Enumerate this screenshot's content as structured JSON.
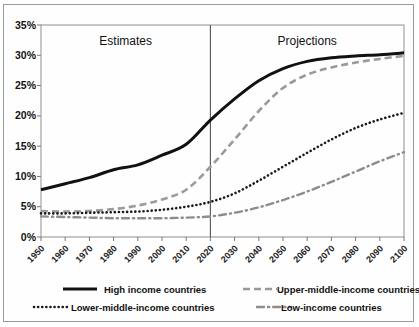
{
  "chart_data": {
    "type": "line",
    "title": "",
    "xlabel": "",
    "ylabel": "",
    "xlim": [
      1950,
      2100
    ],
    "ylim": [
      0,
      35
    ],
    "grid": false,
    "legend_position": "bottom",
    "x": [
      1950,
      1960,
      1970,
      1980,
      1990,
      2000,
      2010,
      2020,
      2030,
      2040,
      2050,
      2060,
      2070,
      2080,
      2090,
      2100
    ],
    "ytick_labels": [
      "0%",
      "5%",
      "10%",
      "15%",
      "20%",
      "25%",
      "30%",
      "35%"
    ],
    "ytick_values": [
      0,
      5,
      10,
      15,
      20,
      25,
      30,
      35
    ],
    "xtick_labels": [
      "1950",
      "1960",
      "1970",
      "1980",
      "1990",
      "2000",
      "2010",
      "2020",
      "2030",
      "2040",
      "2050",
      "2060",
      "2070",
      "2080",
      "2090",
      "2100"
    ],
    "annotations": [
      {
        "text": "Estimates",
        "x": 1985
      },
      {
        "text": "Projections",
        "x": 2060
      },
      {
        "text": "divider",
        "x": 2020
      }
    ],
    "series": [
      {
        "name": "High income countries",
        "style": "solid",
        "color": "#111111",
        "values": [
          7.8,
          8.8,
          9.8,
          11.1,
          11.9,
          13.5,
          15.3,
          19.3,
          22.8,
          25.8,
          27.8,
          29.0,
          29.6,
          29.9,
          30.1,
          30.4
        ]
      },
      {
        "name": "Upper-middle-income countries",
        "style": "dashed",
        "color": "#9a9a9a",
        "values": [
          4.3,
          4.2,
          4.3,
          4.6,
          5.2,
          6.2,
          7.8,
          11.6,
          16.1,
          20.8,
          24.6,
          26.8,
          28.0,
          28.8,
          29.4,
          29.9
        ]
      },
      {
        "name": "Lower-middle-income countries",
        "style": "dotted",
        "color": "#1a1a1a",
        "values": [
          3.9,
          3.9,
          4.0,
          4.1,
          4.2,
          4.5,
          5.0,
          5.8,
          7.2,
          9.3,
          11.6,
          13.9,
          16.1,
          18.0,
          19.4,
          20.5
        ]
      },
      {
        "name": "Low-income countries",
        "style": "dashdot",
        "color": "#8d8d8d",
        "values": [
          3.4,
          3.3,
          3.2,
          3.1,
          3.1,
          3.1,
          3.2,
          3.4,
          4.0,
          4.9,
          6.1,
          7.5,
          9.1,
          10.8,
          12.5,
          14.0
        ]
      }
    ]
  },
  "legend": {
    "items": [
      {
        "label": "High income countries"
      },
      {
        "label": "Upper-middle-income countries"
      },
      {
        "label": "Lower-middle-income countries"
      },
      {
        "label": "Low-income countries"
      }
    ]
  }
}
